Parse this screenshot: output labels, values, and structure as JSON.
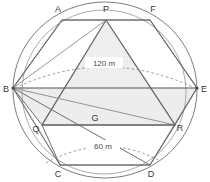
{
  "diagram": {
    "vertex_labels": {
      "A": "A",
      "P": "P",
      "F": "F",
      "B": "B",
      "E": "E",
      "Q": "Q",
      "G": "G",
      "R": "R",
      "C": "C",
      "D": "D"
    },
    "dimensions": {
      "major": "120 m",
      "minor": "60 m"
    },
    "colors": {
      "stroke_dark": "#555555",
      "stroke_mid": "#7d7d7d",
      "stroke_light": "#a9a9a9",
      "fill_shade": "#eeeeee",
      "label_text": "#3a3a3a",
      "background": "#ffffff"
    }
  }
}
